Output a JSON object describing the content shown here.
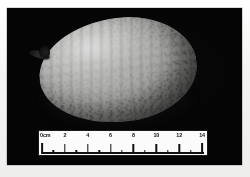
{
  "figure": {
    "caption": "Photograph of a single ovoid fruit specimen on a black background, shown with a centimetre scale bar.",
    "background_color": "#050505",
    "page_color": "#f2f2f0"
  },
  "specimen": {
    "name": "fruit-specimen",
    "shape": "ovoid",
    "orientation": "stem end at left, tapering to the right",
    "surface": "mottled, faintly ribbed skin",
    "stem_label": "peduncle",
    "body_color_light": "#e2e2e0",
    "body_color_mid": "#bdbdbb",
    "body_color_dark": "#3a3a39",
    "stem_color": "#141414"
  },
  "scale_bar": {
    "name": "centimeter-scale-bar",
    "unit": "cm",
    "origin_label": "0cm",
    "min": 0,
    "max": 14,
    "major_interval": 2,
    "minor_interval": 1,
    "labels": [
      "0cm",
      "2",
      "4",
      "6",
      "8",
      "10",
      "12",
      "14"
    ],
    "label_values": [
      0,
      2,
      4,
      6,
      8,
      10,
      12,
      14
    ],
    "tick_values": [
      0,
      1,
      2,
      3,
      4,
      5,
      6,
      7,
      8,
      9,
      10,
      11,
      12,
      13,
      14
    ],
    "background_color": "#fbfbfb",
    "ink_color": "#101010"
  }
}
